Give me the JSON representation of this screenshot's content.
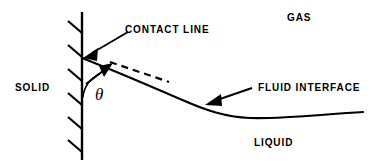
{
  "figure": {
    "background_color": "#ffffff",
    "stroke_color": "#000000",
    "width": 380,
    "height": 166
  },
  "labels": {
    "gas": "GAS",
    "liquid": "LIQUID",
    "solid": "SOLID",
    "contact_line": "CONTACT LINE",
    "fluid_interface": "FLUID INTERFACE",
    "contact_angle": "θ"
  },
  "geometry": {
    "wall": {
      "name": "solid-wall",
      "x": 82,
      "y_top": 12,
      "y_bottom": 160,
      "hatch_count": 6,
      "hatch_length": 14,
      "hatch_angle_deg": 45
    },
    "interface_curve": {
      "name": "fluid-interface-curve",
      "path": "M 82,58 C 120,73 150,86 180,99 C 205,110 225,117 250,118 C 285,119 325,114 363,112",
      "start": [
        82,
        58
      ],
      "end": [
        363,
        112
      ]
    },
    "tangent_dashed": {
      "name": "tangent-dashed-line",
      "from": [
        110,
        62
      ],
      "to": [
        169,
        82
      ],
      "dash_pattern": "7,5"
    },
    "angle_arc": {
      "name": "contact-angle-arc",
      "path": "M 83,97 C 84,86 90,79 99,74"
    },
    "arrows": [
      {
        "name": "contact-line-arrow",
        "from": [
          128,
          32
        ],
        "to": [
          85,
          57
        ]
      },
      {
        "name": "contact-angle-arrow",
        "from": [
          86,
          84
        ],
        "to": [
          112,
          64
        ]
      },
      {
        "name": "fluid-interface-arrow",
        "from": [
          252,
          88
        ],
        "to": [
          206,
          104
        ]
      }
    ]
  }
}
